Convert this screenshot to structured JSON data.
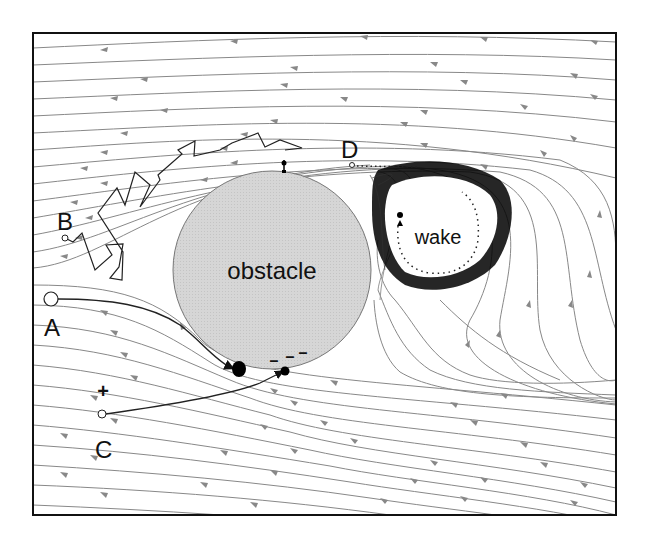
{
  "figure": {
    "type": "flow-diagram",
    "labels": {
      "obstacle": "obstacle",
      "wake": "wake",
      "A": "A",
      "B": "B",
      "C": "C",
      "D": "D",
      "plus": "+",
      "minus1": "–",
      "minus2": "–",
      "minus3": "–"
    },
    "colors": {
      "obstacle_fill": "#d4d4d4",
      "streamline": "#777777",
      "trajectory": "#222222",
      "wake_ring": "#000000",
      "frame": "#111111"
    },
    "trajectories": [
      {
        "id": "A",
        "kind": "smooth, hits obstacle lower-left"
      },
      {
        "id": "B",
        "kind": "random walk (zigzag) over top of obstacle"
      },
      {
        "id": "C",
        "kind": "charged (+) attracted to negative charges on obstacle"
      },
      {
        "id": "D",
        "kind": "captured into wake (dotted path)"
      }
    ]
  }
}
